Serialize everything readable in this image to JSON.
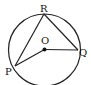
{
  "diagram": {
    "type": "circle-geometry",
    "circle": {
      "center_label": "O",
      "cx": 44.5,
      "cy": 50,
      "r": 36
    },
    "points": {
      "R": {
        "label": "R",
        "x": 44,
        "y": 14
      },
      "Q": {
        "label": "Q",
        "x": 78,
        "y": 50
      },
      "P": {
        "label": "P",
        "x": 15,
        "y": 66
      },
      "O": {
        "label": "O",
        "x": 44.5,
        "y": 49.5
      }
    },
    "segments": [
      "PR",
      "RQ",
      "OP",
      "OQ"
    ],
    "stroke_color": "#222222"
  }
}
